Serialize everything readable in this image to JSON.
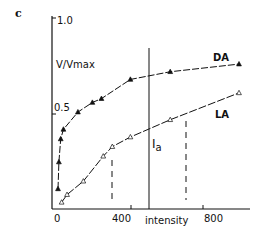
{
  "chart_data": {
    "type": "line",
    "panel_label": "c",
    "title": "",
    "xlabel": "intensity",
    "ylabel": "V/Vmax",
    "xlim": [
      0,
      1050
    ],
    "ylim": [
      0,
      1.0
    ],
    "x_ticks": [
      0,
      400,
      800
    ],
    "y_ticks": [
      0.5,
      1.0
    ],
    "grid": false,
    "legend": "inline labels near curve ends",
    "series": [
      {
        "name": "DA",
        "marker": "filled-triangle",
        "line": "dash-dot",
        "x": [
          0,
          5,
          15,
          30,
          110,
          190,
          240,
          400,
          620,
          1000
        ],
        "y": [
          0.11,
          0.25,
          0.37,
          0.42,
          0.51,
          0.56,
          0.58,
          0.68,
          0.72,
          0.76
        ]
      },
      {
        "name": "LA",
        "marker": "open-triangle",
        "line": "dash-dot",
        "x": [
          20,
          50,
          140,
          250,
          300,
          400,
          620,
          1000
        ],
        "y": [
          0.04,
          0.08,
          0.15,
          0.28,
          0.33,
          0.38,
          0.47,
          0.61
        ]
      }
    ],
    "annotations": [
      {
        "type": "vline",
        "x": 500,
        "label": "Ia",
        "style": "solid"
      },
      {
        "type": "vline",
        "x": 300,
        "style": "dashed",
        "y_range": [
          0.05,
          0.26
        ]
      },
      {
        "type": "vline",
        "x": 700,
        "style": "dashed",
        "y_range": [
          0.05,
          0.47
        ]
      }
    ]
  },
  "labels": {
    "panel": "c",
    "y_top": "1.0",
    "y_mid": "0.5",
    "ylabel": "V/Vmax",
    "x0": "0",
    "x400": "400",
    "x800": "800",
    "xlabel": "intensity",
    "da": "DA",
    "la": "LA",
    "ia_main": "I",
    "ia_sub": "a"
  }
}
